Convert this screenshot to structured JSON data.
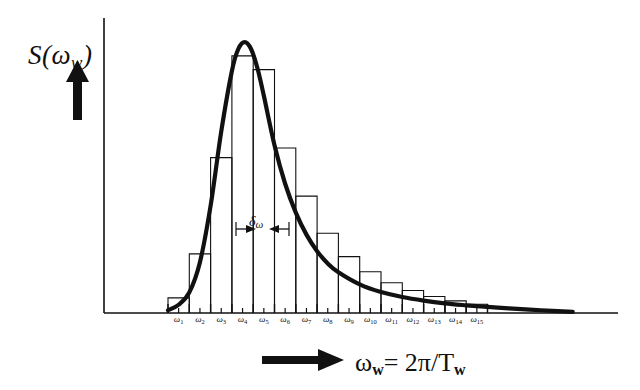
{
  "figure": {
    "background_color": "#ffffff",
    "ink_color": "#111111",
    "y_axis_label": "S(",
    "y_axis_label_symbol": "ω",
    "y_axis_label_sub": "w",
    "y_axis_label_close": ")",
    "x_axis_label_symbol": "ω",
    "x_axis_label_sub": "w",
    "x_axis_label_rest": "= 2π/T",
    "x_axis_label_rest_sub": "w",
    "bandwidth_symbol": "δω",
    "bandwidth_label_main": "δ",
    "bandwidth_label_sub": "ω",
    "y_arrow_name": "up-arrow",
    "x_arrow_name": "right-arrow"
  },
  "chart_data": {
    "type": "bar",
    "title": "",
    "subtitle": "",
    "xlabel": "ω_w = 2π/T_w",
    "ylabel": "S(ω_w)",
    "grid": false,
    "legend": "none",
    "annotations": [
      {
        "text": "δω",
        "type": "double-headed-arrow",
        "meaning": "frequency band width between adjacent components",
        "x_start_category": "ω₅",
        "x_end_category": "ω₆",
        "y_value": 0.28
      }
    ],
    "axis_note": "axes unlabeled numerically; spectral density versus wave frequency",
    "xlim": [
      0,
      16
    ],
    "ylim": [
      0,
      1
    ],
    "categories": [
      "ω₁",
      "ω₂",
      "ω₃",
      "ω₄",
      "ω₅",
      "ω₆",
      "ω₇",
      "ω₈",
      "ω₉",
      "ω₁₀",
      "ω₁₁",
      "ω₁₂",
      "ω₁₃",
      "ω₁₄",
      "ω₁₅"
    ],
    "tick_labels": [
      {
        "main": "ω",
        "sub": "1"
      },
      {
        "main": "ω",
        "sub": "2"
      },
      {
        "main": "ω",
        "sub": "3"
      },
      {
        "main": "ω",
        "sub": "4"
      },
      {
        "main": "ω",
        "sub": "5"
      },
      {
        "main": "ω",
        "sub": "6"
      },
      {
        "main": "ω",
        "sub": "7"
      },
      {
        "main": "ω",
        "sub": "8"
      },
      {
        "main": "ω",
        "sub": "9"
      },
      {
        "main": "ω",
        "sub": "10"
      },
      {
        "main": "ω",
        "sub": "11"
      },
      {
        "main": "ω",
        "sub": "12"
      },
      {
        "main": "ω",
        "sub": "13"
      },
      {
        "main": "ω",
        "sub": "14"
      },
      {
        "main": "ω",
        "sub": "15"
      }
    ],
    "values": [
      0.055,
      0.215,
      0.565,
      0.935,
      0.885,
      0.6,
      0.425,
      0.29,
      0.205,
      0.15,
      0.11,
      0.082,
      0.06,
      0.044,
      0.032
    ],
    "series": [
      {
        "name": "discretised spectrum (histogram)",
        "values": [
          0.055,
          0.215,
          0.565,
          0.935,
          0.885,
          0.6,
          0.425,
          0.29,
          0.205,
          0.15,
          0.11,
          0.082,
          0.06,
          0.044,
          0.032
        ]
      },
      {
        "name": "continuous spectral density curve",
        "x": [
          0.0,
          0.5,
          1.0,
          1.5,
          2.0,
          2.5,
          3.0,
          3.3,
          3.6,
          3.9,
          4.2,
          4.5,
          5.0,
          5.5,
          6.0,
          6.5,
          7.0,
          7.5,
          8.0,
          9.0,
          10.0,
          11.0,
          12.0,
          13.0,
          14.0,
          15.0,
          16.0,
          17.5,
          19.0
        ],
        "y": [
          0.01,
          0.03,
          0.075,
          0.185,
          0.39,
          0.66,
          0.88,
          0.96,
          0.985,
          0.96,
          0.89,
          0.79,
          0.61,
          0.47,
          0.365,
          0.285,
          0.225,
          0.18,
          0.148,
          0.104,
          0.076,
          0.058,
          0.045,
          0.035,
          0.028,
          0.022,
          0.017,
          0.01,
          0.004
        ]
      }
    ]
  }
}
